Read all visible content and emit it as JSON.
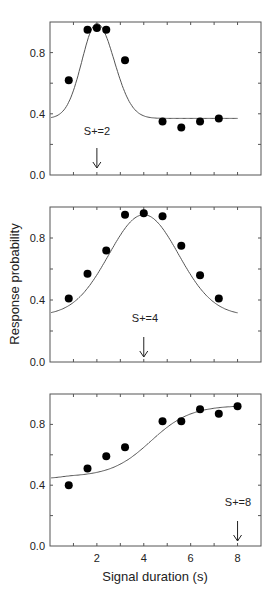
{
  "figure": {
    "ylabel": "Response probability",
    "xlabel": "Signal duration (s)"
  },
  "chart_data": [
    {
      "type": "scatter",
      "panel": "top",
      "annotation": "S+=2",
      "arrow_x": 2,
      "xlim": [
        0,
        9
      ],
      "ylim": [
        0,
        1
      ],
      "yticks": [
        0.0,
        0.4,
        0.8
      ],
      "ytick_labels": [
        "0.0",
        "0.4",
        "0.8"
      ],
      "x": [
        0.8,
        1.6,
        2.0,
        2.4,
        3.2,
        4.8,
        5.6,
        6.4,
        7.2
      ],
      "values": [
        0.62,
        0.95,
        0.96,
        0.95,
        0.75,
        0.35,
        0.31,
        0.35,
        0.37
      ],
      "fit_curve": "peaked fit, baseline ~0.37 at x=0, peak ~0.99 at x=2, plateau ~0.37 from x=5 to 8"
    },
    {
      "type": "scatter",
      "panel": "middle",
      "annotation": "S+=4",
      "arrow_x": 4,
      "xlim": [
        0,
        9
      ],
      "ylim": [
        0,
        1
      ],
      "yticks": [
        0.0,
        0.4,
        0.8
      ],
      "ytick_labels": [
        "0.0",
        "0.4",
        "0.8"
      ],
      "x": [
        0.8,
        1.6,
        2.4,
        3.2,
        4.0,
        4.8,
        5.6,
        6.4,
        7.2
      ],
      "values": [
        0.41,
        0.57,
        0.72,
        0.95,
        0.96,
        0.94,
        0.75,
        0.56,
        0.41
      ],
      "fit_curve": "symmetric bell, ~0.32 at x=0 and x=8, peak ~0.95 at x=4"
    },
    {
      "type": "scatter",
      "panel": "bottom",
      "annotation": "S+=8",
      "arrow_x": 8,
      "xlim": [
        0,
        9
      ],
      "ylim": [
        0,
        1
      ],
      "yticks": [
        0.0,
        0.4,
        0.8
      ],
      "ytick_labels": [
        "0.0",
        "0.4",
        "0.8"
      ],
      "xticks": [
        2,
        4,
        6,
        8
      ],
      "xtick_labels": [
        "2",
        "4",
        "6",
        "8"
      ],
      "x": [
        0.8,
        1.6,
        2.4,
        3.2,
        4.8,
        5.6,
        6.4,
        7.2,
        8.0
      ],
      "values": [
        0.4,
        0.51,
        0.59,
        0.65,
        0.82,
        0.82,
        0.9,
        0.87,
        0.92
      ],
      "fit_curve": "sigmoid rise, ~0.46 at x=0 to ~0.92 at x=8"
    }
  ]
}
